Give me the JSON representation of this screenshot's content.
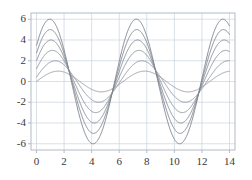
{
  "figure": {
    "background": "#ffffff",
    "title": "",
    "width": 252,
    "height": 180
  },
  "axes": {
    "frame_color": "#aab4c2",
    "grid_color": "#c9d3de",
    "grid_on": true,
    "tick_color": "#3a3a3a",
    "x_ticks": [
      "0",
      "2",
      "4",
      "6",
      "8",
      "10",
      "12",
      "14"
    ],
    "y_ticks": [
      "6",
      "4",
      "2",
      "0",
      "-2",
      "-4",
      "-6"
    ],
    "xlabel": "",
    "ylabel": ""
  },
  "chart_data": {
    "type": "line",
    "title": "",
    "xlabel": "",
    "ylabel": "",
    "xlim": [
      -0.4,
      14.4
    ],
    "ylim": [
      -6.6,
      6.6
    ],
    "xticks": [
      0,
      2,
      4,
      6,
      8,
      10,
      12,
      14
    ],
    "yticks": [
      -6,
      -4,
      -2,
      0,
      2,
      4,
      6
    ],
    "grid": true,
    "legend": "none",
    "line_color": "#8a8f99",
    "line_width": 1.0,
    "series": [
      {
        "name": "amplitude-1",
        "amplitude": 1,
        "period": 6.283,
        "phase_deg": 0,
        "color": "#9aa0a8",
        "peaks_x": [
          1.57,
          7.85,
          14.14
        ],
        "troughs_x": [
          4.71,
          10.99
        ],
        "y_at_x0": 0.0
      },
      {
        "name": "amplitude-2",
        "amplitude": 2,
        "period": 6.283,
        "phase_deg": 12,
        "color": "#949aa3",
        "peaks_x": [
          1.36,
          7.64,
          13.93
        ],
        "troughs_x": [
          4.5,
          10.78
        ],
        "y_at_x0": 0.42
      },
      {
        "name": "amplitude-3",
        "amplitude": 3,
        "period": 6.283,
        "phase_deg": 24,
        "color": "#8f959f",
        "peaks_x": [
          1.15,
          7.43,
          13.72
        ],
        "troughs_x": [
          4.29,
          10.57
        ],
        "y_at_x0": 1.22
      },
      {
        "name": "amplitude-4",
        "amplitude": 4,
        "period": 6.283,
        "phase_deg": 30,
        "color": "#8a9099",
        "peaks_x": [
          1.05,
          7.33,
          13.61
        ],
        "troughs_x": [
          4.19,
          10.47
        ],
        "y_at_x0": 2.0
      },
      {
        "name": "amplitude-5",
        "amplitude": 5,
        "period": 6.283,
        "phase_deg": 33,
        "color": "#858b95",
        "peaks_x": [
          1.0,
          7.28,
          13.56
        ],
        "troughs_x": [
          4.14,
          10.42
        ],
        "y_at_x0": 2.72
      },
      {
        "name": "amplitude-6",
        "amplitude": 6,
        "period": 6.283,
        "phase_deg": 35,
        "color": "#808690",
        "peaks_x": [
          0.96,
          7.24,
          13.53
        ],
        "troughs_x": [
          4.1,
          10.38
        ],
        "y_at_x0": 3.44
      }
    ]
  }
}
